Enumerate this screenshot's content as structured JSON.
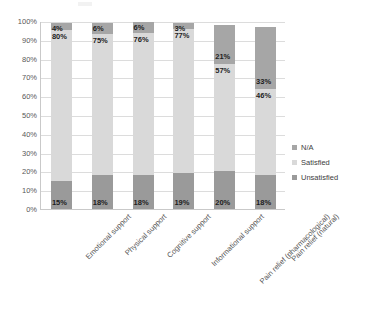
{
  "chart_data": {
    "type": "bar",
    "subtype": "100% stacked column",
    "title": "",
    "xlabel": "",
    "ylabel": "",
    "ylim": [
      0,
      100
    ],
    "ytick_labels": [
      "100%",
      "90%",
      "80%",
      "70%",
      "60%",
      "50%",
      "40%",
      "30%",
      "20%",
      "10%",
      "0%"
    ],
    "ytick_values": [
      100,
      90,
      80,
      70,
      60,
      50,
      40,
      30,
      20,
      10,
      0
    ],
    "grid": true,
    "legend_position": "right",
    "categories": [
      "Emotional support",
      "Physical support",
      "Cognitive support",
      "Informational support",
      "Pain relief (pharmacological)",
      "Pain relief (natural)"
    ],
    "series": [
      {
        "name": "Unsatisfied",
        "color": "#9a9a9a",
        "values": [
          15,
          18,
          18,
          19,
          20,
          18
        ],
        "labels": [
          "15%",
          "18%",
          "18%",
          "19%",
          "20%",
          "18%"
        ]
      },
      {
        "name": "Satisfied",
        "color": "#d9d9d9",
        "values": [
          80,
          75,
          76,
          77,
          57,
          46
        ],
        "labels": [
          "80%",
          "75%",
          "76%",
          "77%",
          "57%",
          "46%"
        ]
      },
      {
        "name": "N/A",
        "color": "#a6a6a6",
        "values": [
          4,
          6,
          6,
          3,
          21,
          33
        ],
        "labels": [
          "4%",
          "6%",
          "6%",
          "3%",
          "21%",
          "33%"
        ]
      }
    ],
    "legend_entries": [
      "N/A",
      "Satisfied",
      "Unsatisfied"
    ]
  }
}
